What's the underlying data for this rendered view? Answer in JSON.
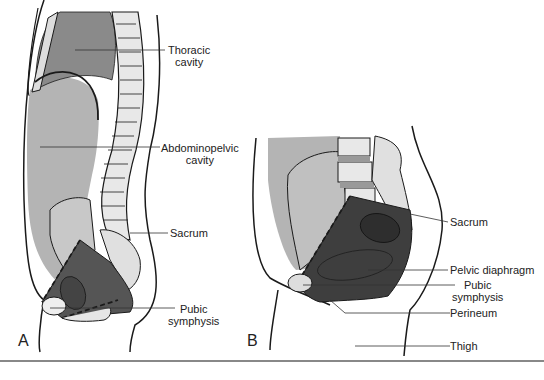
{
  "figure": {
    "colors": {
      "cavity_dark": "#8a8a8a",
      "cavity_light": "#b4b4b4",
      "pelvic_dark": "#4a4a4a",
      "bone": "#e8e8e8",
      "outline": "#1a1a1a",
      "rule": "#888888"
    },
    "panels": [
      {
        "letter": "A",
        "labels": [
          {
            "id": "thoracic",
            "lines": [
              "Thoracic",
              "cavity"
            ]
          },
          {
            "id": "abdominopelvic",
            "lines": [
              "Abdominopelvic",
              "cavity"
            ]
          },
          {
            "id": "sacrum",
            "lines": [
              "Sacrum"
            ]
          },
          {
            "id": "pubic",
            "lines": [
              "Pubic",
              "symphysis"
            ]
          }
        ]
      },
      {
        "letter": "B",
        "labels": [
          {
            "id": "sacrum",
            "lines": [
              "Sacrum"
            ]
          },
          {
            "id": "pelvic-diaphragm",
            "lines": [
              "Pelvic diaphragm"
            ]
          },
          {
            "id": "pubic",
            "lines": [
              "Pubic",
              "symphysis"
            ]
          },
          {
            "id": "perineum",
            "lines": [
              "Perineum"
            ]
          },
          {
            "id": "thigh",
            "lines": [
              "Thigh"
            ]
          }
        ]
      }
    ]
  }
}
